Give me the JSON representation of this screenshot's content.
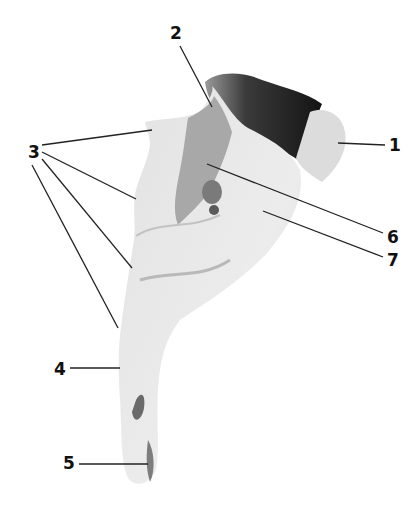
{
  "figure": {
    "type": "anatomical-specimen-photo",
    "colors": {
      "background": "#ffffff",
      "bone_light": "#e6e6e6",
      "bone_mid": "#c4c4c4",
      "bone_dark": "#8a8a8a",
      "bone_shadow": "#1e1e1e",
      "leader_line": "#222222",
      "label_text": "#111111"
    },
    "labels": [
      {
        "id": "1",
        "text": "1",
        "x": 389,
        "y": 137
      },
      {
        "id": "2",
        "text": "2",
        "x": 170,
        "y": 25
      },
      {
        "id": "3",
        "text": "3",
        "x": 28,
        "y": 144
      },
      {
        "id": "4",
        "text": "4",
        "x": 54,
        "y": 361
      },
      {
        "id": "5",
        "text": "5",
        "x": 63,
        "y": 435
      },
      {
        "id": "6",
        "text": "6",
        "x": 387,
        "y": 232
      },
      {
        "id": "7",
        "text": "7",
        "x": 387,
        "y": 254
      }
    ],
    "leader_lines": [
      {
        "label": "1",
        "x1": 385,
        "y1": 145,
        "x2": 338,
        "y2": 143
      },
      {
        "label": "2",
        "x1": 180,
        "y1": 46,
        "x2": 212,
        "y2": 107
      },
      {
        "label": "3",
        "x1": 42,
        "y1": 145,
        "x2": 152,
        "y2": 130
      },
      {
        "label": "3",
        "x1": 42,
        "y1": 152,
        "x2": 136,
        "y2": 199
      },
      {
        "label": "3",
        "x1": 42,
        "y1": 159,
        "x2": 132,
        "y2": 268
      },
      {
        "label": "3",
        "x1": 32,
        "y1": 165,
        "x2": 118,
        "y2": 328
      },
      {
        "label": "4",
        "x1": 70,
        "y1": 368,
        "x2": 120,
        "y2": 368
      },
      {
        "label": "5",
        "x1": 79,
        "y1": 464,
        "x2": 148,
        "y2": 464
      },
      {
        "label": "6",
        "x1": 383,
        "y1": 233,
        "x2": 207,
        "y2": 164
      },
      {
        "label": "7",
        "x1": 383,
        "y1": 257,
        "x2": 263,
        "y2": 211
      }
    ]
  }
}
